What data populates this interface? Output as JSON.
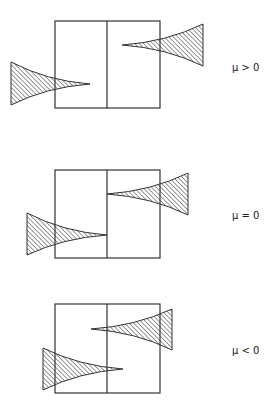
{
  "figure": {
    "stroke_color": "#333333",
    "hatch_color": "#333333",
    "panels": [
      {
        "label": "μ > 0",
        "box": {
          "x": 55,
          "y": 21,
          "w": 105,
          "h": 87,
          "mid_x": 107
        },
        "left_wedge": {
          "base_x": 11,
          "base_top": 62,
          "base_bottom": 105,
          "tip_x": 90,
          "tip_y": 84
        },
        "right_wedge": {
          "base_x": 203,
          "base_top": 24,
          "base_bottom": 66,
          "tip_x": 122,
          "tip_y": 45
        },
        "label_pos": {
          "x": 232,
          "y": 71
        }
      },
      {
        "label": "μ = 0",
        "box": {
          "x": 55,
          "y": 170,
          "w": 105,
          "h": 88,
          "mid_x": 107
        },
        "left_wedge": {
          "base_x": 27,
          "base_top": 213,
          "base_bottom": 255,
          "tip_x": 107,
          "tip_y": 235
        },
        "right_wedge": {
          "base_x": 188,
          "base_top": 173,
          "base_bottom": 215,
          "tip_x": 107,
          "tip_y": 194
        },
        "label_pos": {
          "x": 232,
          "y": 219
        }
      },
      {
        "label": "μ < 0",
        "box": {
          "x": 55,
          "y": 304,
          "w": 105,
          "h": 89,
          "mid_x": 107
        },
        "left_wedge": {
          "base_x": 43,
          "base_top": 348,
          "base_bottom": 390,
          "tip_x": 123,
          "tip_y": 369
        },
        "right_wedge": {
          "base_x": 172,
          "base_top": 309,
          "base_bottom": 350,
          "tip_x": 91,
          "tip_y": 329
        },
        "label_pos": {
          "x": 232,
          "y": 354
        }
      }
    ]
  }
}
